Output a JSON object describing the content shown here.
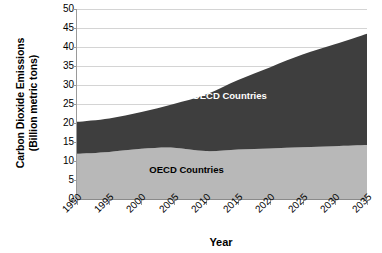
{
  "chart_data": {
    "type": "area",
    "stacked": true,
    "title": "",
    "xlabel": "Year",
    "ylabel": "Carbon Dioxide Emissions (Billion metric tons)",
    "ylabel_lines": [
      "Carbon Dioxide Emissions",
      "(Billion metric tons)"
    ],
    "grid": true,
    "grid_axis": "y",
    "legend_position": "in-plot-annotations",
    "xlim": [
      1990,
      2035
    ],
    "ylim": [
      0,
      50
    ],
    "yticks": [
      0,
      5,
      10,
      15,
      20,
      25,
      30,
      35,
      40,
      45,
      50
    ],
    "ytick_labels": [
      "0",
      "5",
      "10",
      "15",
      "20",
      "25",
      "30",
      "35",
      "40",
      "45",
      "50"
    ],
    "xticks": [
      1990,
      1995,
      2000,
      2005,
      2010,
      2015,
      2020,
      2025,
      2030,
      2035
    ],
    "xtick_labels": [
      "1990",
      "1995",
      "2000",
      "2005",
      "2010",
      "2015",
      "2020",
      "2025",
      "2030",
      "2035"
    ],
    "x": [
      1990,
      1995,
      2000,
      2005,
      2010,
      2015,
      2020,
      2025,
      2030,
      2035
    ],
    "series": [
      {
        "name": "OECD Countries",
        "color": "#b8b8b8",
        "label_color": "#000000",
        "values": [
          11.9,
          12.4,
          13.2,
          13.5,
          12.6,
          13.0,
          13.3,
          13.6,
          13.9,
          14.2
        ]
      },
      {
        "name": "Non-OECD Countries",
        "color": "#3e3e3e",
        "label_color": "#ffffff",
        "values": [
          8.4,
          8.8,
          9.7,
          11.5,
          14.9,
          18.3,
          21.4,
          24.4,
          26.8,
          29.3
        ]
      }
    ],
    "totals": [
      20.3,
      21.2,
      22.9,
      25.0,
      27.5,
      31.3,
      34.7,
      38.0,
      40.7,
      43.5
    ],
    "annotations": [
      {
        "text": "Non-OECD Countries",
        "x": 2012,
        "y": 27.5
      },
      {
        "text": "OECD Countries",
        "x": 2007,
        "y": 8.0
      }
    ]
  },
  "axis": {
    "x_title": "Year",
    "y_title_line1": "Carbon Dioxide Emissions",
    "y_title_line2": "(Billion metric tons)"
  }
}
